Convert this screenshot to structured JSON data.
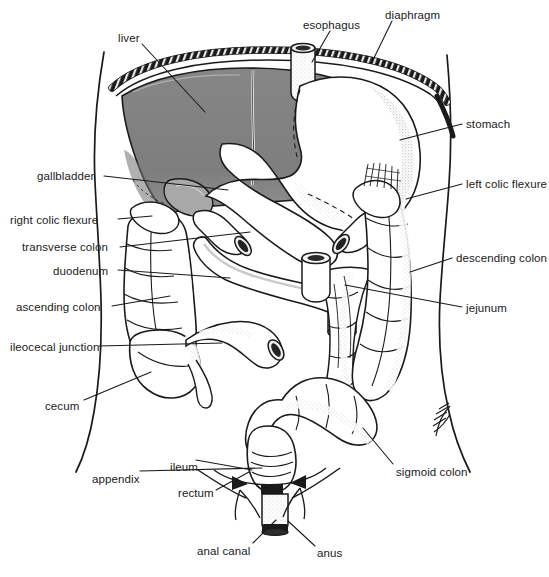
{
  "figure": {
    "style": "line-drawing",
    "background_color": "#ffffff",
    "ink_color": "#1a1a1a",
    "liver_fill_color": "#808080",
    "stipple_color": "#b4b4b4"
  },
  "labels": [
    {
      "id": "liver",
      "text": "liver",
      "x": 118,
      "y": 32,
      "align": "left",
      "leader": [
        [
          142,
          44
        ],
        [
          205,
          112
        ]
      ]
    },
    {
      "id": "esophagus",
      "text": "esophagus",
      "x": 303,
      "y": 19,
      "align": "left",
      "leader": [
        [
          330,
          31
        ],
        [
          312,
          62
        ]
      ]
    },
    {
      "id": "diaphragm",
      "text": "diaphragm",
      "x": 385,
      "y": 9,
      "align": "left",
      "leader": [
        [
          392,
          21
        ],
        [
          372,
          62
        ]
      ]
    },
    {
      "id": "stomach",
      "text": "stomach",
      "x": 466,
      "y": 118,
      "align": "left",
      "leader": [
        [
          462,
          124
        ],
        [
          400,
          140
        ]
      ]
    },
    {
      "id": "left-colic-flexure",
      "text": "left colic flexure",
      "x": 466,
      "y": 178,
      "align": "left",
      "leader": [
        [
          462,
          184
        ],
        [
          406,
          199
        ]
      ]
    },
    {
      "id": "descending-colon",
      "text": "descending colon",
      "x": 456,
      "y": 252,
      "align": "left",
      "leader": [
        [
          452,
          258
        ],
        [
          410,
          272
        ]
      ]
    },
    {
      "id": "jejunum",
      "text": "jejunum",
      "x": 466,
      "y": 302,
      "align": "left",
      "leader": [
        [
          462,
          307
        ],
        [
          345,
          285
        ]
      ]
    },
    {
      "id": "sigmoid-colon",
      "text": "sigmoid colon",
      "x": 396,
      "y": 466,
      "align": "left",
      "leader": [
        [
          393,
          464
        ],
        [
          363,
          428
        ]
      ]
    },
    {
      "id": "anus",
      "text": "anus",
      "x": 317,
      "y": 547,
      "align": "left",
      "leader": [
        [
          315,
          546
        ],
        [
          288,
          521
        ]
      ]
    },
    {
      "id": "anal-canal",
      "text": "anal canal",
      "x": 197,
      "y": 545,
      "align": "left",
      "leader": [
        [
          253,
          543
        ],
        [
          276,
          520
        ]
      ]
    },
    {
      "id": "rectum",
      "text": "rectum",
      "x": 178,
      "y": 487,
      "align": "left",
      "leader": [
        [
          216,
          490
        ],
        [
          249,
          472
        ]
      ]
    },
    {
      "id": "ileum",
      "text": "ileum",
      "x": 170,
      "y": 461,
      "align": "left",
      "leader": [
        [
          196,
          460
        ],
        [
          252,
          470
        ]
      ]
    },
    {
      "id": "appendix",
      "text": "appendix",
      "x": 92,
      "y": 473,
      "align": "left",
      "leader": [
        [
          140,
          471
        ],
        [
          262,
          468
        ]
      ]
    },
    {
      "id": "cecum",
      "text": "cecum",
      "x": 45,
      "y": 400,
      "align": "left",
      "leader": [
        [
          84,
          400
        ],
        [
          151,
          372
        ]
      ]
    },
    {
      "id": "ileocecal-junction",
      "text": "ileocecal junction",
      "x": 10,
      "y": 341,
      "align": "left",
      "leader": [
        [
          99,
          346
        ],
        [
          222,
          343
        ]
      ]
    },
    {
      "id": "ascending-colon",
      "text": "ascending colon",
      "x": 16,
      "y": 301,
      "align": "left",
      "leader": [
        [
          112,
          306
        ],
        [
          170,
          296
        ]
      ]
    },
    {
      "id": "duodenum",
      "text": "duodenum",
      "x": 53,
      "y": 265,
      "align": "left",
      "leader": [
        [
          118,
          270
        ],
        [
          230,
          278
        ]
      ]
    },
    {
      "id": "transverse-colon",
      "text": "transverse colon",
      "x": 22,
      "y": 241,
      "align": "left",
      "leader": [
        [
          120,
          247
        ],
        [
          250,
          232
        ]
      ]
    },
    {
      "id": "right-colic-flexure",
      "text": "right colic flexure",
      "x": 10,
      "y": 214,
      "align": "left",
      "leader": [
        [
          118,
          219
        ],
        [
          152,
          216
        ]
      ]
    },
    {
      "id": "gallbladder",
      "text": "gallbladder",
      "x": 37,
      "y": 170,
      "align": "left",
      "leader": [
        [
          104,
          176
        ],
        [
          228,
          190
        ]
      ]
    }
  ]
}
